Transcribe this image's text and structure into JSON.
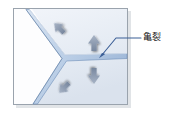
{
  "figure": {
    "type": "technical-illustration",
    "background_color": "#ffffff"
  },
  "specimen": {
    "name": "material-block",
    "fill_top_color": "#eef2f8",
    "fill_bottom_color": "#dde5ef",
    "border_color": "#9aa3ad",
    "shadow_color": "#c9ced4",
    "bounds": {
      "x": 13,
      "y": 8,
      "width": 115,
      "height": 97
    }
  },
  "crack": {
    "name": "crack-shape",
    "label": "亀裂",
    "fill_color": "#c4d5ec",
    "stroke_color": "#5b7fae",
    "branch_count": 3,
    "branches": [
      {
        "name": "upper-left-branch",
        "direction": "up-left"
      },
      {
        "name": "lower-left-branch",
        "direction": "down-left"
      },
      {
        "name": "right-branch",
        "direction": "right"
      }
    ],
    "junction": {
      "x": 63,
      "y": 58
    },
    "wedge_fill_color": "#ffffff"
  },
  "callout": {
    "name": "crack-callout",
    "text": "亀裂",
    "text_color": "#1a1a1a",
    "leader_color": "#3b5e96",
    "leader_start": {
      "x": 141,
      "y": 38
    },
    "leader_bend": {
      "x": 116,
      "y": 38
    },
    "leader_tip": {
      "x": 99,
      "y": 57
    }
  },
  "arrows": [
    {
      "name": "arrow-up-left",
      "direction": "up-left",
      "x": 59,
      "y": 28,
      "angle": -45,
      "color": "#8c9cb4"
    },
    {
      "name": "arrow-up",
      "direction": "up",
      "x": 94,
      "y": 43,
      "angle": 0,
      "color": "#8c9cb4"
    },
    {
      "name": "arrow-down",
      "direction": "down",
      "x": 94,
      "y": 76,
      "angle": 180,
      "color": "#8c9cb4"
    },
    {
      "name": "arrow-down-left",
      "direction": "down-left",
      "x": 64,
      "y": 88,
      "angle": 225,
      "color": "#8c9cb4"
    }
  ]
}
